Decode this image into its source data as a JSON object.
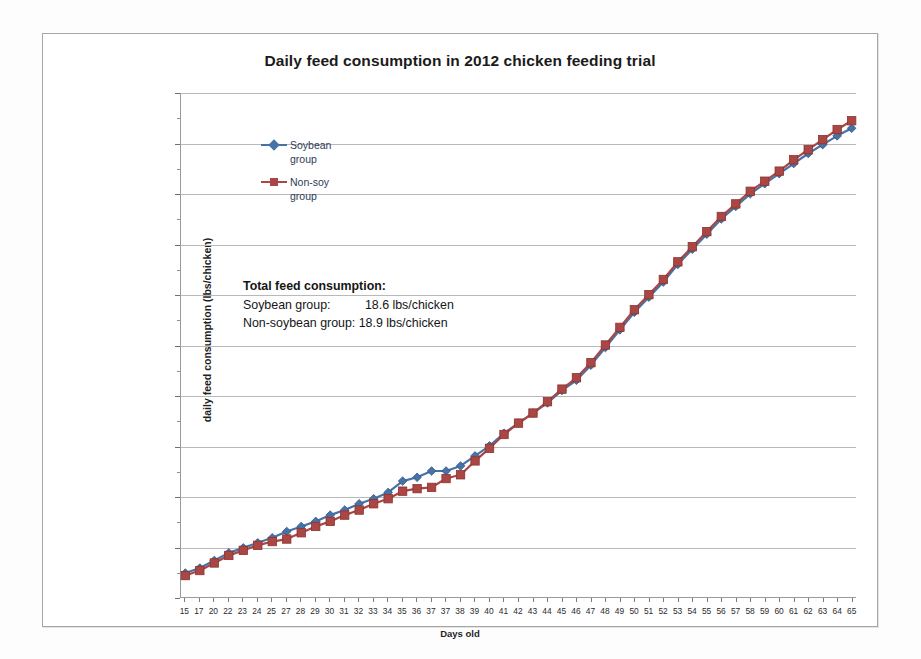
{
  "chart_data": {
    "type": "line",
    "title": "Daily feed consumption in 2012 chicken feeding trial",
    "xlabel": "Days old",
    "ylabel": "daily feed consumption (lbs/chicken)",
    "ylim": [
      0,
      20
    ],
    "ytick_step": 2,
    "yticks": [
      0,
      2,
      4,
      6,
      8,
      10,
      12,
      14,
      16,
      18,
      20
    ],
    "grid": true,
    "legend_position": "inside-top-left",
    "categories": [
      "15",
      "17",
      "20",
      "22",
      "23",
      "24",
      "25",
      "27",
      "28",
      "29",
      "30",
      "31",
      "32",
      "33",
      "34",
      "35",
      "36",
      "37",
      "37",
      "38",
      "39",
      "40",
      "41",
      "42",
      "43",
      "44",
      "45",
      "46",
      "47",
      "48",
      "49",
      "50",
      "51",
      "52",
      "53",
      "54",
      "55",
      "56",
      "57",
      "58",
      "59",
      "60",
      "61",
      "62",
      "63",
      "64",
      "65"
    ],
    "series": [
      {
        "name": "Soybean group",
        "color": "#4572a7",
        "marker": "diamond",
        "values": [
          0.95,
          1.15,
          1.45,
          1.75,
          1.95,
          2.15,
          2.35,
          2.6,
          2.8,
          3.0,
          3.25,
          3.45,
          3.7,
          3.9,
          4.15,
          4.6,
          4.75,
          5.0,
          5.0,
          5.2,
          5.6,
          6.0,
          6.5,
          6.9,
          7.3,
          7.7,
          8.2,
          8.6,
          9.2,
          9.9,
          10.6,
          11.3,
          11.9,
          12.5,
          13.2,
          13.8,
          14.4,
          15.0,
          15.5,
          16.0,
          16.4,
          16.8,
          17.2,
          17.6,
          17.95,
          18.3,
          18.6
        ]
      },
      {
        "name": "Non-soy group",
        "color": "#aa4643",
        "marker": "square",
        "values": [
          0.85,
          1.05,
          1.35,
          1.65,
          1.85,
          2.05,
          2.2,
          2.3,
          2.55,
          2.8,
          3.0,
          3.25,
          3.45,
          3.7,
          3.9,
          4.2,
          4.3,
          4.35,
          4.7,
          4.85,
          5.4,
          5.9,
          6.45,
          6.9,
          7.3,
          7.75,
          8.25,
          8.7,
          9.3,
          10.0,
          10.7,
          11.4,
          12.0,
          12.6,
          13.3,
          13.9,
          14.5,
          15.1,
          15.6,
          16.1,
          16.5,
          16.9,
          17.35,
          17.75,
          18.15,
          18.55,
          18.9
        ]
      }
    ],
    "annotation": {
      "heading": "Total feed consumption:",
      "rows": [
        "Soybean group:          18.6 lbs/chicken",
        "Non-soybean group: 18.9 lbs/chicken"
      ]
    }
  },
  "legend": {
    "entries": [
      {
        "line1": "Soybean",
        "line2": "group"
      },
      {
        "line1": "Non-soy",
        "line2": "group"
      }
    ]
  },
  "colors": {
    "soybean": "#4572a7",
    "nonsoy": "#aa4643",
    "gridline": "#b9b9b9",
    "axis": "#9a9a9a",
    "frame": "#a6a6a6"
  }
}
